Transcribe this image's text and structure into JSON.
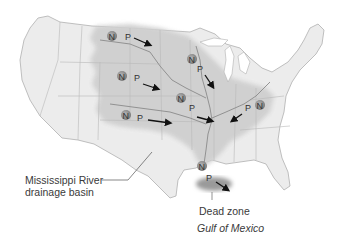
{
  "map": {
    "title": "Mississippi River drainage basin and Gulf of Mexico dead zone",
    "labels": {
      "basin": [
        "Mississippi River",
        "drainage basin"
      ],
      "dead_zone": "Dead zone",
      "gulf": "Gulf of Mexico"
    },
    "markers": [
      {
        "id": "upper-missouri",
        "n": "N",
        "p": "P"
      },
      {
        "id": "minnesota",
        "n": "N",
        "p": "P"
      },
      {
        "id": "nebraska",
        "n": "N",
        "p": "P"
      },
      {
        "id": "iowa",
        "n": "N",
        "p": "P"
      },
      {
        "id": "kansas",
        "n": "N",
        "p": "P"
      },
      {
        "id": "ohio",
        "n": "N",
        "p": "P"
      },
      {
        "id": "louisiana",
        "n": "N",
        "p": "P"
      }
    ],
    "legend_key": {
      "N": "Nitrogen",
      "P": "Phosphorus"
    },
    "colors": {
      "land": "#ececec",
      "basin": "#cfcfcf",
      "state_lines": "#b4b4b4",
      "dead_zone": "#9a9a9a",
      "marker": "#8c8c8c",
      "arrow": "#111111",
      "text": "#3a3a3a"
    }
  }
}
